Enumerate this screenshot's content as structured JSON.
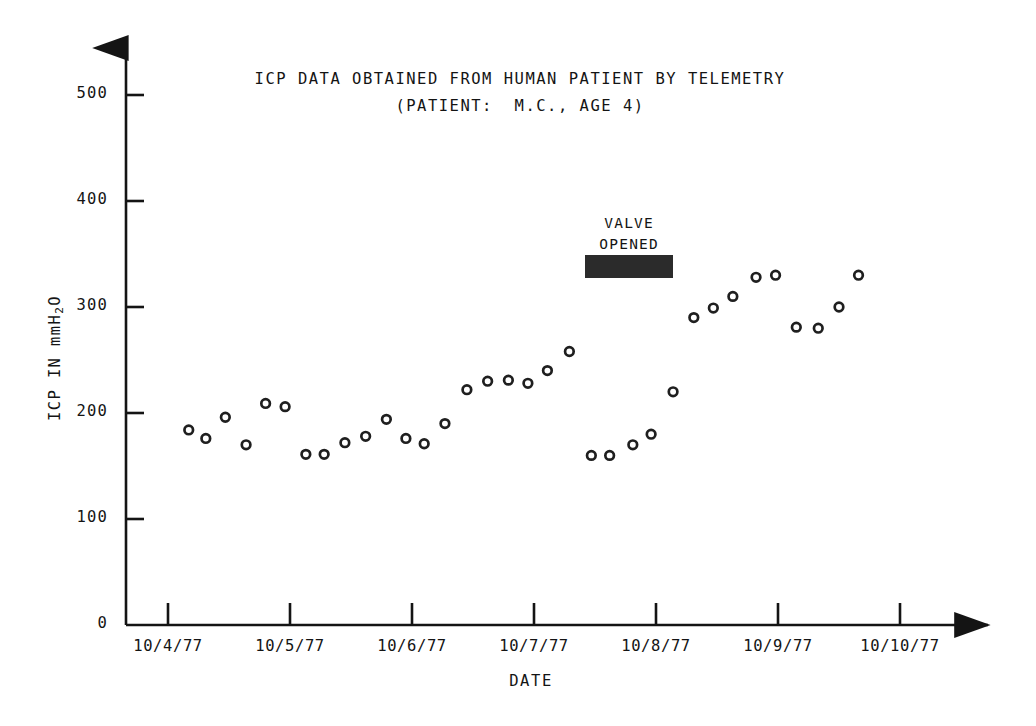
{
  "figure": {
    "title_lines": [
      "ICP DATA OBTAINED FROM HUMAN PATIENT BY TELEMETRY",
      "(PATIENT:  M.C., AGE 4)"
    ],
    "background_color": "#ffffff",
    "ink_color": "#141414",
    "annotation_bar_color": "#2b2b2b"
  },
  "annotation": {
    "label_line_1": "VALVE",
    "label_line_2": "OPENED",
    "bar_start_date": "10/7/77 05:00",
    "bar_end_date": "10/7/77 22:00"
  },
  "chart_data": {
    "type": "scatter",
    "title": "ICP DATA OBTAINED FROM HUMAN PATIENT BY TELEMETRY",
    "subtitle": "(PATIENT:  M.C., AGE 4)",
    "xlabel": "DATE",
    "ylabel": "ICP IN mmH2O",
    "ylim": [
      0,
      520
    ],
    "yticks": [
      0,
      100,
      200,
      300,
      400,
      500
    ],
    "ytick_labels": [
      "0",
      "100",
      "200",
      "300",
      "400",
      "500"
    ],
    "xticks": [
      0,
      1,
      2,
      3,
      4,
      5,
      6
    ],
    "xtick_labels": [
      "10/4/77",
      "10/5/77",
      "10/6/77",
      "10/7/77",
      "10/8/77",
      "10/9/77",
      "10/10/77"
    ],
    "xlim": [
      -0.35,
      6.5
    ],
    "grid": false,
    "legend": null,
    "marker": "open-circle",
    "series": [
      {
        "name": "ICP",
        "points": [
          {
            "x": 0.17,
            "y": 184
          },
          {
            "x": 0.31,
            "y": 176
          },
          {
            "x": 0.47,
            "y": 196
          },
          {
            "x": 0.64,
            "y": 170
          },
          {
            "x": 0.8,
            "y": 209
          },
          {
            "x": 0.96,
            "y": 206
          },
          {
            "x": 1.13,
            "y": 161
          },
          {
            "x": 1.28,
            "y": 161
          },
          {
            "x": 1.45,
            "y": 172
          },
          {
            "x": 1.62,
            "y": 178
          },
          {
            "x": 1.79,
            "y": 194
          },
          {
            "x": 1.95,
            "y": 176
          },
          {
            "x": 2.1,
            "y": 171
          },
          {
            "x": 2.27,
            "y": 190
          },
          {
            "x": 2.45,
            "y": 222
          },
          {
            "x": 2.62,
            "y": 230
          },
          {
            "x": 2.79,
            "y": 231
          },
          {
            "x": 2.95,
            "y": 228
          },
          {
            "x": 3.11,
            "y": 240
          },
          {
            "x": 3.29,
            "y": 258
          },
          {
            "x": 3.47,
            "y": 160
          },
          {
            "x": 3.62,
            "y": 160
          },
          {
            "x": 3.81,
            "y": 170
          },
          {
            "x": 3.96,
            "y": 180
          },
          {
            "x": 4.14,
            "y": 220
          },
          {
            "x": 4.31,
            "y": 290
          },
          {
            "x": 4.47,
            "y": 299
          },
          {
            "x": 4.63,
            "y": 310
          },
          {
            "x": 4.82,
            "y": 328
          },
          {
            "x": 4.98,
            "y": 330
          },
          {
            "x": 5.15,
            "y": 281
          },
          {
            "x": 5.33,
            "y": 280
          },
          {
            "x": 5.5,
            "y": 300
          },
          {
            "x": 5.66,
            "y": 330
          }
        ]
      }
    ]
  }
}
